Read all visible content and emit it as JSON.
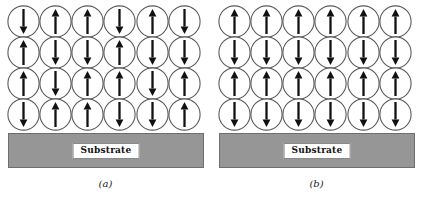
{
  "figure": {
    "width": 423,
    "height": 199,
    "background_color": "#ffffff",
    "substrate_color": "#969696",
    "arrow_color": "#111111",
    "circle_stroke_color": "#5a5a5a"
  },
  "panels": [
    {
      "id": "a",
      "caption": "(a)",
      "substrate_label": "Substrate",
      "columns": 6,
      "rows": 4,
      "spin_rows": [
        [
          "down",
          "up",
          "up",
          "down",
          "up",
          "down"
        ],
        [
          "up",
          "down",
          "down",
          "up",
          "down",
          "down"
        ],
        [
          "up",
          "down",
          "up",
          "up",
          "down",
          "up"
        ],
        [
          "down",
          "up",
          "up",
          "down",
          "down",
          "up"
        ]
      ]
    },
    {
      "id": "b",
      "caption": "(b)",
      "substrate_label": "Substrate",
      "columns": 6,
      "rows": 4,
      "spin_rows": [
        [
          "up",
          "up",
          "up",
          "up",
          "up",
          "up"
        ],
        [
          "down",
          "down",
          "down",
          "down",
          "down",
          "down"
        ],
        [
          "up",
          "up",
          "up",
          "up",
          "up",
          "up"
        ],
        [
          "down",
          "down",
          "down",
          "down",
          "down",
          "down"
        ]
      ]
    }
  ]
}
